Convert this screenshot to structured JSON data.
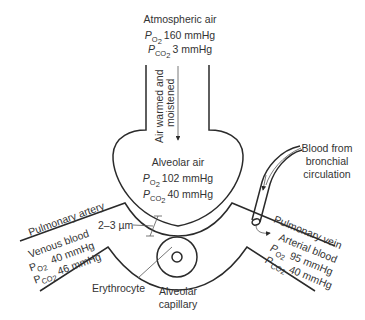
{
  "diagram": {
    "atmospheric": {
      "label": "Atmospheric air",
      "po2_symbol": "P",
      "po2_sub": "O2",
      "po2_sub_main": "O",
      "po2_sub_idx": "2",
      "po2_value": "160 mmHg",
      "pco2_symbol": "P",
      "pco2_sub_main": "CO",
      "pco2_sub_idx": "2",
      "pco2_value": "3 mmHg"
    },
    "airway_arrow_label_line1": "Air warmed and",
    "airway_arrow_label_line2": "moistened",
    "alveolar": {
      "label": "Alveolar air",
      "po2_symbol": "P",
      "po2_sub_main": "O",
      "po2_sub_idx": "2",
      "po2_value": "102 mmHg",
      "pco2_symbol": "P",
      "pco2_sub_main": "CO",
      "pco2_sub_idx": "2",
      "pco2_value": "40 mmHg"
    },
    "bronchial": {
      "line1": "Blood from",
      "line2": "bronchial",
      "line3": "circulation"
    },
    "pulmonary_artery": "Pulmonary artery",
    "pulmonary_vein": "Pulmonary vein",
    "venous": {
      "label": "Venous blood",
      "po2_symbol": "P",
      "po2_sub_main": "O",
      "po2_sub_idx": "2",
      "po2_value": "40 mmHg",
      "pco2_symbol": "P",
      "pco2_sub_main": "CO",
      "pco2_sub_idx": "2",
      "pco2_value": "46 mmHg"
    },
    "arterial": {
      "label": "Arterial blood",
      "po2_symbol": "P",
      "po2_sub_main": "O",
      "po2_sub_idx": "2",
      "po2_value": "95 mmHg",
      "pco2_symbol": "P",
      "pco2_sub_main": "CO",
      "pco2_sub_idx": "2",
      "pco2_value": "40 mmHg"
    },
    "membrane_thickness": "2–3 µm",
    "erythrocyte": "Erythrocyte",
    "capillary_line1": "Alveolar",
    "capillary_line2": "capillary"
  }
}
